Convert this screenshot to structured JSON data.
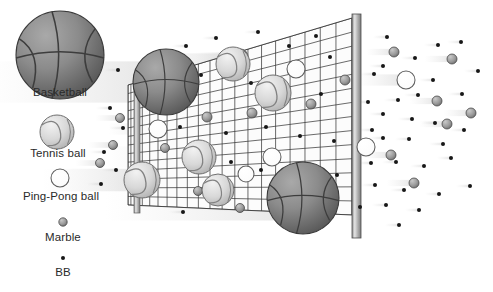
{
  "figure": {
    "title": "",
    "background_color": "#ffffff"
  },
  "legend": {
    "name": "projectile-size-legend",
    "position": "left",
    "items": [
      {
        "id": "basketball",
        "label": "Basketball",
        "glyph": "basketball-icon",
        "radius": 44,
        "cx": 60,
        "cy": 55,
        "label_x": 60,
        "label_y": 92,
        "fill": "#8a8a8a",
        "stroke": "#3c3c3c",
        "blocked": true
      },
      {
        "id": "tennis-ball",
        "label": "Tennis ball",
        "glyph": "tennis-ball-icon",
        "radius": 17,
        "cx": 57,
        "cy": 132,
        "label_x": 57,
        "label_y": 152,
        "fill": "#d2d2d2",
        "stroke": "#6e6e6e",
        "blocked": true
      },
      {
        "id": "ping-pong-ball",
        "label": "Ping-Pong ball",
        "glyph": "ping-pong-ball-icon",
        "radius": 9,
        "cx": 60,
        "cy": 178,
        "label_x": 60,
        "label_y": 195,
        "fill": "#ffffff",
        "stroke": "#6e6e6e",
        "blocked": false
      },
      {
        "id": "marble",
        "label": "Marble",
        "glyph": "marble-icon",
        "radius": 4.2,
        "cx": 63,
        "cy": 222,
        "label_x": 63,
        "label_y": 236,
        "fill": "#9a9a9a",
        "stroke": "#555555",
        "blocked": false
      },
      {
        "id": "bb",
        "label": "BB",
        "glyph": "bb-icon",
        "radius": 2.0,
        "cx": 63,
        "cy": 258,
        "label_x": 63,
        "label_y": 272,
        "fill": "#1a1a1a",
        "stroke": "#1a1a1a",
        "blocked": false
      }
    ]
  },
  "net": {
    "name": "mesh-net",
    "mesh_color": "#3a3a3a",
    "fill_color": "#fbfbfb",
    "corners": {
      "top_left": [
        128,
        85
      ],
      "top_right": [
        352,
        18
      ],
      "bottom_right": [
        352,
        215
      ],
      "bottom_left": [
        128,
        205
      ]
    },
    "columns": 20,
    "rows": 14,
    "left_post": {
      "name": "net-post-left",
      "x": 134,
      "y_top": 78,
      "y_bottom": 213,
      "width": 6,
      "color": "#b4b4b4"
    },
    "right_post": {
      "name": "net-post-right",
      "x": 352,
      "y_top": 14,
      "y_bottom": 238,
      "width": 9,
      "color": "#b8b8b8"
    }
  },
  "scene": {
    "blocked_balls": [
      {
        "type": "basketball",
        "cx": 166,
        "cy": 82,
        "r": 33
      },
      {
        "type": "basketball",
        "cx": 303,
        "cy": 198,
        "r": 36
      },
      {
        "type": "tennis-ball",
        "cx": 233,
        "cy": 64,
        "r": 17
      },
      {
        "type": "tennis-ball",
        "cx": 273,
        "cy": 93,
        "r": 18
      },
      {
        "type": "tennis-ball",
        "cx": 199,
        "cy": 157,
        "r": 17
      },
      {
        "type": "tennis-ball",
        "cx": 218,
        "cy": 190,
        "r": 16
      },
      {
        "type": "tennis-ball-through",
        "cx": 142,
        "cy": 180,
        "r": 18
      }
    ],
    "passing_through_net": [
      {
        "type": "ping-pong-ball",
        "cx": 240,
        "cy": 57,
        "r": 8
      },
      {
        "type": "ping-pong-ball",
        "cx": 296,
        "cy": 69,
        "r": 9
      },
      {
        "type": "ping-pong-ball",
        "cx": 158,
        "cy": 129,
        "r": 9
      },
      {
        "type": "ping-pong-ball",
        "cx": 272,
        "cy": 157,
        "r": 9
      },
      {
        "type": "ping-pong-ball",
        "cx": 246,
        "cy": 174,
        "r": 8
      },
      {
        "type": "marble",
        "cx": 207,
        "cy": 117,
        "r": 5
      },
      {
        "type": "marble",
        "cx": 252,
        "cy": 113,
        "r": 5
      },
      {
        "type": "marble",
        "cx": 311,
        "cy": 104,
        "r": 5
      },
      {
        "type": "marble",
        "cx": 345,
        "cy": 80,
        "r": 5
      },
      {
        "type": "marble",
        "cx": 165,
        "cy": 148,
        "r": 4.5
      },
      {
        "type": "marble",
        "cx": 198,
        "cy": 191,
        "r": 4.5
      },
      {
        "type": "marble",
        "cx": 240,
        "cy": 208,
        "r": 4.5
      },
      {
        "type": "bb",
        "cx": 186,
        "cy": 46,
        "r": 2
      },
      {
        "type": "bb",
        "cx": 216,
        "cy": 38,
        "r": 2
      },
      {
        "type": "bb",
        "cx": 258,
        "cy": 32,
        "r": 2
      },
      {
        "type": "bb",
        "cx": 289,
        "cy": 46,
        "r": 2
      },
      {
        "type": "bb",
        "cx": 316,
        "cy": 36,
        "r": 2
      },
      {
        "type": "bb",
        "cx": 330,
        "cy": 57,
        "r": 2
      },
      {
        "type": "bb",
        "cx": 201,
        "cy": 75,
        "r": 2
      },
      {
        "type": "bb",
        "cx": 251,
        "cy": 83,
        "r": 2
      },
      {
        "type": "bb",
        "cx": 288,
        "cy": 91,
        "r": 2
      },
      {
        "type": "bb",
        "cx": 321,
        "cy": 94,
        "r": 2
      },
      {
        "type": "bb",
        "cx": 180,
        "cy": 127,
        "r": 2
      },
      {
        "type": "bb",
        "cx": 226,
        "cy": 133,
        "r": 2
      },
      {
        "type": "bb",
        "cx": 266,
        "cy": 127,
        "r": 2
      },
      {
        "type": "bb",
        "cx": 300,
        "cy": 136,
        "r": 2
      },
      {
        "type": "bb",
        "cx": 334,
        "cy": 141,
        "r": 2
      },
      {
        "type": "bb",
        "cx": 193,
        "cy": 166,
        "r": 2
      },
      {
        "type": "bb",
        "cx": 231,
        "cy": 162,
        "r": 2
      },
      {
        "type": "bb",
        "cx": 261,
        "cy": 170,
        "r": 2
      },
      {
        "type": "bb",
        "cx": 337,
        "cy": 175,
        "r": 2
      },
      {
        "type": "bb",
        "cx": 183,
        "cy": 212,
        "r": 2
      },
      {
        "type": "bb",
        "cx": 236,
        "cy": 60,
        "r": 2
      }
    ],
    "incoming_left": [
      {
        "type": "bb",
        "cx": 118,
        "cy": 70,
        "r": 2
      },
      {
        "type": "bb",
        "cx": 110,
        "cy": 108,
        "r": 2
      },
      {
        "type": "bb",
        "cx": 123,
        "cy": 128,
        "r": 2
      },
      {
        "type": "bb",
        "cx": 104,
        "cy": 152,
        "r": 2
      },
      {
        "type": "bb",
        "cx": 116,
        "cy": 170,
        "r": 2
      },
      {
        "type": "bb",
        "cx": 101,
        "cy": 184,
        "r": 2
      },
      {
        "type": "marble",
        "cx": 120,
        "cy": 118,
        "r": 4.5
      },
      {
        "type": "marble",
        "cx": 113,
        "cy": 145,
        "r": 4.5
      },
      {
        "type": "marble",
        "cx": 100,
        "cy": 163,
        "r": 4.5
      }
    ],
    "passed_right": [
      {
        "type": "ping-pong-ball",
        "cx": 406,
        "cy": 80,
        "r": 9
      },
      {
        "type": "ping-pong-ball",
        "cx": 366,
        "cy": 147,
        "r": 9
      },
      {
        "type": "marble",
        "cx": 394,
        "cy": 52,
        "r": 5
      },
      {
        "type": "marble",
        "cx": 452,
        "cy": 59,
        "r": 5
      },
      {
        "type": "marble",
        "cx": 437,
        "cy": 101,
        "r": 5
      },
      {
        "type": "marble",
        "cx": 471,
        "cy": 113,
        "r": 5
      },
      {
        "type": "marble",
        "cx": 447,
        "cy": 124,
        "r": 5
      },
      {
        "type": "marble",
        "cx": 391,
        "cy": 155,
        "r": 5
      },
      {
        "type": "marble",
        "cx": 414,
        "cy": 183,
        "r": 5
      },
      {
        "type": "bb",
        "cx": 387,
        "cy": 37,
        "r": 2
      },
      {
        "type": "bb",
        "cx": 438,
        "cy": 45,
        "r": 2
      },
      {
        "type": "bb",
        "cx": 461,
        "cy": 42,
        "r": 2
      },
      {
        "type": "bb",
        "cx": 415,
        "cy": 58,
        "r": 2
      },
      {
        "type": "bb",
        "cx": 383,
        "cy": 66,
        "r": 2
      },
      {
        "type": "bb",
        "cx": 478,
        "cy": 71,
        "r": 2
      },
      {
        "type": "bb",
        "cx": 374,
        "cy": 74,
        "r": 2
      },
      {
        "type": "bb",
        "cx": 433,
        "cy": 80,
        "r": 2
      },
      {
        "type": "bb",
        "cx": 368,
        "cy": 102,
        "r": 2
      },
      {
        "type": "bb",
        "cx": 398,
        "cy": 100,
        "r": 2
      },
      {
        "type": "bb",
        "cx": 418,
        "cy": 95,
        "r": 2
      },
      {
        "type": "bb",
        "cx": 462,
        "cy": 94,
        "r": 2
      },
      {
        "type": "bb",
        "cx": 383,
        "cy": 114,
        "r": 2
      },
      {
        "type": "bb",
        "cx": 412,
        "cy": 119,
        "r": 2
      },
      {
        "type": "bb",
        "cx": 435,
        "cy": 123,
        "r": 2
      },
      {
        "type": "bb",
        "cx": 464,
        "cy": 130,
        "r": 2
      },
      {
        "type": "bb",
        "cx": 372,
        "cy": 130,
        "r": 2
      },
      {
        "type": "bb",
        "cx": 409,
        "cy": 139,
        "r": 2
      },
      {
        "type": "bb",
        "cx": 443,
        "cy": 144,
        "r": 2
      },
      {
        "type": "bb",
        "cx": 383,
        "cy": 138,
        "r": 2
      },
      {
        "type": "bb",
        "cx": 396,
        "cy": 162,
        "r": 2
      },
      {
        "type": "bb",
        "cx": 424,
        "cy": 166,
        "r": 2
      },
      {
        "type": "bb",
        "cx": 371,
        "cy": 163,
        "r": 2
      },
      {
        "type": "bb",
        "cx": 451,
        "cy": 158,
        "r": 2
      },
      {
        "type": "bb",
        "cx": 375,
        "cy": 185,
        "r": 2
      },
      {
        "type": "bb",
        "cx": 404,
        "cy": 190,
        "r": 2
      },
      {
        "type": "bb",
        "cx": 439,
        "cy": 194,
        "r": 2
      },
      {
        "type": "bb",
        "cx": 470,
        "cy": 186,
        "r": 2
      },
      {
        "type": "bb",
        "cx": 386,
        "cy": 205,
        "r": 2
      },
      {
        "type": "bb",
        "cx": 419,
        "cy": 210,
        "r": 2
      },
      {
        "type": "bb",
        "cx": 399,
        "cy": 225,
        "r": 2
      },
      {
        "type": "bb",
        "cx": 360,
        "cy": 207,
        "r": 2
      }
    ]
  }
}
